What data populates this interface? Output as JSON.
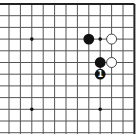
{
  "diagram": {
    "type": "go-board-fragment",
    "corner": "top-right",
    "grid": {
      "cols": 12,
      "rows": 12,
      "origin_x": 9,
      "origin_y": 4,
      "spacing_x": 11.4,
      "spacing_y": 11.7,
      "line_color": "#555555",
      "edge_color": "#222222",
      "thick_edges": [
        "top",
        "right"
      ]
    },
    "hoshi": [
      {
        "col": 2,
        "row": 3
      },
      {
        "col": 8,
        "row": 3
      },
      {
        "col": 2,
        "row": 9
      },
      {
        "col": 8,
        "row": 9
      }
    ],
    "stones": [
      {
        "color": "black",
        "col": 7,
        "row": 3,
        "label": ""
      },
      {
        "color": "white",
        "col": 9,
        "row": 3,
        "label": ""
      },
      {
        "color": "black",
        "col": 8,
        "row": 5,
        "label": ""
      },
      {
        "color": "white",
        "col": 9,
        "row": 5,
        "label": ""
      },
      {
        "color": "black",
        "col": 8,
        "row": 6,
        "label": "1"
      }
    ],
    "colors": {
      "black_stone": "#111111",
      "white_stone": "#ffffff",
      "white_stone_border": "#333333",
      "label_on_black": "#ffffff"
    }
  }
}
